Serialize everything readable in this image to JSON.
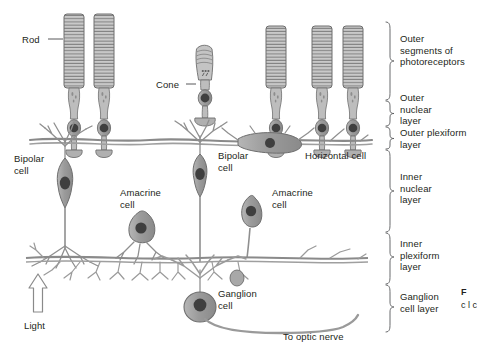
{
  "figure": {
    "background_color": "#ffffff",
    "ink_color": "#231f20",
    "cell_fill": "#9b9b9b",
    "cell_fill_light": "#c4c4c4",
    "nucleus_color": "#4a4a4a",
    "outline_color": "#6e6e6e"
  },
  "cell_labels": [
    {
      "id": "rod",
      "text": "Rod",
      "x": 22,
      "y": 34,
      "align": "left",
      "leader": true
    },
    {
      "id": "cone",
      "text": "Cone",
      "x": 156,
      "y": 79,
      "align": "left",
      "leader": true
    },
    {
      "id": "bipolar-left",
      "text": "Bipolar\ncell",
      "x": 14,
      "y": 153,
      "align": "left",
      "leader": false
    },
    {
      "id": "bipolar-right",
      "text": "Bipolar\ncell",
      "x": 218,
      "y": 150,
      "align": "left",
      "leader": false
    },
    {
      "id": "horizontal",
      "text": "Horizontal cell",
      "x": 305,
      "y": 150,
      "align": "left",
      "leader": false
    },
    {
      "id": "amacrine-left",
      "text": "Amacrine\ncell",
      "x": 120,
      "y": 187,
      "align": "left",
      "leader": false
    },
    {
      "id": "amacrine-right",
      "text": "Amacrine\ncell",
      "x": 272,
      "y": 187,
      "align": "left",
      "leader": false
    },
    {
      "id": "ganglion",
      "text": "Ganglion\ncell",
      "x": 218,
      "y": 288,
      "align": "left",
      "leader": false
    },
    {
      "id": "optic-nerve",
      "text": "To optic nerve",
      "x": 283,
      "y": 331,
      "align": "left",
      "leader": false
    },
    {
      "id": "light",
      "text": "Light",
      "x": 24,
      "y": 320,
      "align": "left",
      "leader": false
    }
  ],
  "layers": [
    {
      "id": "outer-segments",
      "text": "Outer\nsegments of\nphotoreceptors",
      "brace_top": 22,
      "brace_bottom": 100,
      "label_y": 33
    },
    {
      "id": "outer-nuclear",
      "text": "Outer\nnuclear\nlayer",
      "brace_top": 101,
      "brace_bottom": 126,
      "label_y": 92
    },
    {
      "id": "outer-plexiform",
      "text": "Outer plexiform\nlayer",
      "brace_top": 127,
      "brace_bottom": 149,
      "label_y": 127
    },
    {
      "id": "inner-nuclear",
      "text": "Inner\nnuclear\nlayer",
      "brace_top": 150,
      "brace_bottom": 232,
      "label_y": 171
    },
    {
      "id": "inner-plexiform",
      "text": "Inner\nplexiform\nlayer",
      "brace_top": 233,
      "brace_bottom": 284,
      "label_y": 238
    },
    {
      "id": "ganglion-layer",
      "text": "Ganglion\ncell layer",
      "brace_top": 285,
      "brace_bottom": 332,
      "label_y": 291
    }
  ],
  "photoreceptors": [
    {
      "id": "rod-1",
      "type": "rod",
      "x": 74,
      "seg_top": 14,
      "seg_bottom": 88,
      "soma_y": 105
    },
    {
      "id": "rod-2",
      "type": "rod",
      "x": 104,
      "seg_top": 14,
      "seg_bottom": 88,
      "soma_y": 105
    },
    {
      "id": "cone-1",
      "type": "cone",
      "x": 205,
      "seg_top": 52,
      "seg_bottom": 88,
      "soma_y": 105
    },
    {
      "id": "rod-3",
      "type": "rod",
      "x": 276,
      "seg_top": 26,
      "seg_bottom": 88,
      "soma_y": 108
    },
    {
      "id": "rod-4",
      "type": "rod",
      "x": 322,
      "seg_top": 26,
      "seg_bottom": 88,
      "soma_y": 108
    },
    {
      "id": "rod-5",
      "type": "rod",
      "x": 353,
      "seg_top": 26,
      "seg_bottom": 88,
      "soma_y": 108
    }
  ],
  "neurons": [
    {
      "id": "bipolar-cell-left",
      "type": "bipolar",
      "x": 65,
      "y": 178
    },
    {
      "id": "bipolar-cell-right",
      "type": "bipolar",
      "x": 200,
      "y": 165
    },
    {
      "id": "horizontal-cell",
      "type": "horizontal",
      "x": 270,
      "y": 142
    },
    {
      "id": "amacrine-cell-left",
      "type": "amacrine",
      "x": 139,
      "y": 228
    },
    {
      "id": "amacrine-cell-right",
      "type": "amacrine",
      "x": 250,
      "y": 210
    },
    {
      "id": "ganglion-cell",
      "type": "ganglion",
      "x": 200,
      "y": 305
    }
  ],
  "light_arrow": {
    "direction": "up",
    "x": 38,
    "y_top": 276,
    "y_bottom": 312
  },
  "caption": {
    "lead": "F",
    "cap_body": "c\nl\nc"
  }
}
